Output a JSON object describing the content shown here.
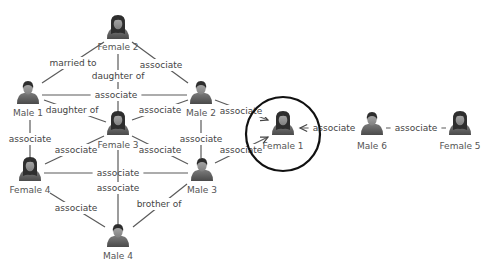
{
  "diagram": {
    "title": "",
    "colors": {
      "edge": "#5a5a5a",
      "label": "#444444",
      "highlight": "#111111",
      "person_dark": "#3a3a3a",
      "person_body": "#6a6a6a",
      "skin": "#8c8c8c"
    },
    "highlight": {
      "node": "female1",
      "cx": 283,
      "cy": 134,
      "r": 37
    },
    "nodes": [
      {
        "id": "female2",
        "label": "Female 2",
        "gender": "female",
        "x": 118,
        "y": 28,
        "ly": 47
      },
      {
        "id": "male1",
        "label": "Male 1",
        "gender": "male",
        "x": 28,
        "y": 93,
        "ly": 113
      },
      {
        "id": "male2",
        "label": "Male 2",
        "gender": "male",
        "x": 201,
        "y": 93,
        "ly": 113
      },
      {
        "id": "female3",
        "label": "Female 3",
        "gender": "female",
        "x": 118,
        "y": 124,
        "ly": 145
      },
      {
        "id": "female4",
        "label": "Female 4",
        "gender": "female",
        "x": 30,
        "y": 170,
        "ly": 190
      },
      {
        "id": "male3",
        "label": "Male 3",
        "gender": "male",
        "x": 202,
        "y": 170,
        "ly": 190
      },
      {
        "id": "male4",
        "label": "Male 4",
        "gender": "male",
        "x": 118,
        "y": 236,
        "ly": 256
      },
      {
        "id": "female1",
        "label": "Female 1",
        "gender": "female",
        "x": 283,
        "y": 124,
        "ly": 146
      },
      {
        "id": "male6",
        "label": "Male 6",
        "gender": "male",
        "x": 372,
        "y": 124,
        "ly": 146
      },
      {
        "id": "female5",
        "label": "Female 5",
        "gender": "female",
        "x": 460,
        "y": 124,
        "ly": 146
      }
    ],
    "edges": [
      {
        "from": "male1",
        "to": "female2",
        "label": "married to",
        "x1": 42,
        "y1": 83,
        "x2": 104,
        "y2": 42,
        "lx": 73,
        "ly": 63
      },
      {
        "from": "female3",
        "to": "female2",
        "label": "daughter of",
        "x1": 118,
        "y1": 112,
        "x2": 118,
        "y2": 54,
        "lx": 118,
        "ly": 76
      },
      {
        "from": "female2",
        "to": "male2",
        "label": "associate",
        "x1": 132,
        "y1": 42,
        "x2": 188,
        "y2": 83,
        "lx": 161,
        "ly": 65
      },
      {
        "from": "male1",
        "to": "male2",
        "label": "associate",
        "x1": 42,
        "y1": 95,
        "x2": 187,
        "y2": 95,
        "lx": 116,
        "ly": 95
      },
      {
        "from": "female3",
        "to": "male1",
        "label": "daughter of",
        "x1": 106,
        "y1": 122,
        "x2": 44,
        "y2": 100,
        "lx": 72,
        "ly": 110
      },
      {
        "from": "female3",
        "to": "male2",
        "label": "associate",
        "x1": 132,
        "y1": 120,
        "x2": 188,
        "y2": 100,
        "lx": 160,
        "ly": 110
      },
      {
        "from": "male2",
        "to": "female1",
        "label": "associate",
        "x1": 215,
        "y1": 100,
        "x2": 268,
        "y2": 120,
        "lx": 241,
        "ly": 111,
        "arrow": true
      },
      {
        "from": "male1",
        "to": "female4",
        "label": "associate",
        "x1": 30,
        "y1": 120,
        "x2": 30,
        "y2": 158,
        "lx": 30,
        "ly": 139
      },
      {
        "from": "female4",
        "to": "female3",
        "label": "associate",
        "x1": 45,
        "y1": 164,
        "x2": 104,
        "y2": 136,
        "lx": 76,
        "ly": 150
      },
      {
        "from": "female3",
        "to": "male3",
        "label": "associate",
        "x1": 132,
        "y1": 136,
        "x2": 188,
        "y2": 164,
        "lx": 160,
        "ly": 150
      },
      {
        "from": "male2",
        "to": "male3",
        "label": "associate",
        "x1": 201,
        "y1": 120,
        "x2": 201,
        "y2": 158,
        "lx": 201,
        "ly": 139
      },
      {
        "from": "male3",
        "to": "female1",
        "label": "associate",
        "x1": 215,
        "y1": 163,
        "x2": 268,
        "y2": 137,
        "lx": 241,
        "ly": 150,
        "arrow": true
      },
      {
        "from": "female4",
        "to": "male3",
        "label": "associate",
        "x1": 44,
        "y1": 173,
        "x2": 188,
        "y2": 173,
        "lx": 118,
        "ly": 173
      },
      {
        "from": "female3",
        "to": "male4",
        "label": "associate",
        "x1": 118,
        "y1": 150,
        "x2": 118,
        "y2": 224,
        "lx": 118,
        "ly": 188
      },
      {
        "from": "female4",
        "to": "male4",
        "label": "associate",
        "x1": 50,
        "y1": 193,
        "x2": 105,
        "y2": 227,
        "lx": 76,
        "ly": 208
      },
      {
        "from": "male4",
        "to": "male3",
        "label": "brother of",
        "x1": 133,
        "y1": 227,
        "x2": 187,
        "y2": 184,
        "lx": 159,
        "ly": 204
      },
      {
        "from": "male6",
        "to": "female1",
        "label": "associate",
        "x1": 358,
        "y1": 128,
        "x2": 300,
        "y2": 128,
        "lx": 334,
        "ly": 128,
        "arrow": true
      },
      {
        "from": "female5",
        "to": "male6",
        "label": "associate",
        "x1": 446,
        "y1": 128,
        "x2": 386,
        "y2": 128,
        "lx": 416,
        "ly": 128
      }
    ]
  }
}
